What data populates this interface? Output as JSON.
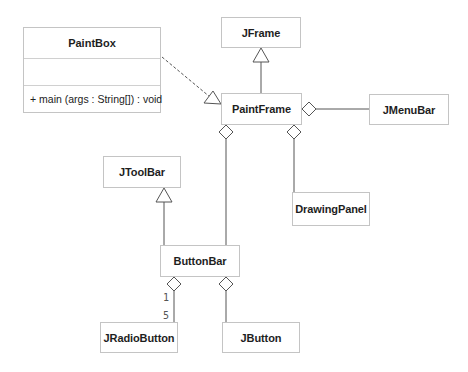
{
  "diagram": {
    "type": "UML class diagram",
    "classes": [
      {
        "id": "PaintBox",
        "name": "PaintBox",
        "attributes": [],
        "operations": [
          "+ main (args : String[]) : void"
        ]
      },
      {
        "id": "JFrame",
        "name": "JFrame"
      },
      {
        "id": "PaintFrame",
        "name": "PaintFrame"
      },
      {
        "id": "JMenuBar",
        "name": "JMenuBar"
      },
      {
        "id": "DrawingPanel",
        "name": "DrawingPanel"
      },
      {
        "id": "JToolBar",
        "name": "JToolBar"
      },
      {
        "id": "ButtonBar",
        "name": "ButtonBar"
      },
      {
        "id": "JRadioButton",
        "name": "JRadioButton"
      },
      {
        "id": "JButton",
        "name": "JButton"
      }
    ],
    "relationships": [
      {
        "from": "PaintBox",
        "to": "PaintFrame",
        "kind": "dependency-realization (dashed, hollow triangle)"
      },
      {
        "from": "PaintFrame",
        "to": "JFrame",
        "kind": "generalization"
      },
      {
        "from": "PaintFrame",
        "to": "JMenuBar",
        "kind": "aggregation"
      },
      {
        "from": "PaintFrame",
        "to": "DrawingPanel",
        "kind": "aggregation"
      },
      {
        "from": "PaintFrame",
        "to": "ButtonBar",
        "kind": "aggregation"
      },
      {
        "from": "ButtonBar",
        "to": "JToolBar",
        "kind": "generalization"
      },
      {
        "from": "ButtonBar",
        "to": "JRadioButton",
        "kind": "aggregation",
        "multiplicity_source": "1",
        "multiplicity_target": "5"
      },
      {
        "from": "ButtonBar",
        "to": "JButton",
        "kind": "aggregation"
      }
    ],
    "labels": {
      "paintbox_op": "+ main (args : String[]) : void",
      "mult_one": "1",
      "mult_five": "5"
    }
  }
}
